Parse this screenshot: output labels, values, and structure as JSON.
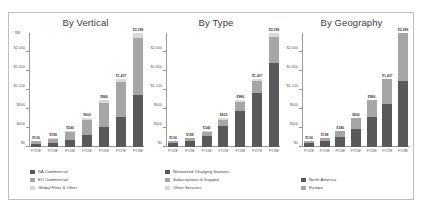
{
  "chart_data": [
    {
      "type": "bar",
      "title": "By Vertical",
      "subtype": "stacked",
      "units_label": "$M",
      "xlabel": "",
      "ylabel": "$M",
      "ylim": [
        0,
        2400
      ],
      "yticks": [
        0,
        400,
        800,
        1200,
        1600,
        2000
      ],
      "ytick_labels": [
        "$0",
        "$400",
        "$800",
        "$1,200",
        "$1,600",
        "$2,000"
      ],
      "grid": false,
      "legend_position": "bottom-left",
      "categories": [
        "FY22E",
        "FY23E",
        "FY24E",
        "FY25E",
        "FY26E",
        "FY27E",
        "FY28E"
      ],
      "totals": [
        136,
        198,
        346,
        602,
        986,
        1437,
        2399
      ],
      "total_labels": [
        "$136",
        "$198",
        "$346",
        "$602",
        "$986",
        "$1,437",
        "$2,399"
      ],
      "series": [
        {
          "name": "NA Commercial",
          "color": "#595959",
          "values": [
            62,
            88,
            150,
            262,
            430,
            640,
            1090
          ]
        },
        {
          "name": "EU Commercial",
          "color": "#a6a6a6",
          "values": [
            58,
            88,
            160,
            300,
            500,
            730,
            1210
          ]
        },
        {
          "name": "Global Fleet & Other",
          "color": "#d9d9d9",
          "values": [
            16,
            22,
            36,
            40,
            56,
            67,
            99
          ]
        }
      ]
    },
    {
      "type": "bar",
      "title": "By Type",
      "subtype": "stacked",
      "units_label": "$M",
      "xlabel": "",
      "ylabel": "$M",
      "ylim": [
        0,
        2400
      ],
      "yticks": [
        0,
        400,
        800,
        1200,
        1600,
        2000
      ],
      "ytick_labels": [
        "$0",
        "$400",
        "$800",
        "$1,200",
        "$1,600",
        "$2,000"
      ],
      "grid": false,
      "legend_position": "bottom-left",
      "categories": [
        "FY22E",
        "FY23E",
        "FY24E",
        "FY25E",
        "FY26E",
        "FY27E",
        "FY28E"
      ],
      "totals": [
        136,
        198,
        346,
        602,
        986,
        1437,
        2399
      ],
      "total_labels": [
        "$136",
        "$198",
        "$346",
        "$602",
        "$986",
        "$1,437",
        "$2,399"
      ],
      "series": [
        {
          "name": "Networked Charging Stations",
          "color": "#595959",
          "values": [
            76,
            128,
            238,
            446,
            752,
            1130,
            1760
          ]
        },
        {
          "name": "Subscriptions & Support",
          "color": "#a6a6a6",
          "values": [
            44,
            52,
            80,
            124,
            196,
            257,
            559
          ]
        },
        {
          "name": "Other Services",
          "color": "#d9d9d9",
          "values": [
            16,
            18,
            28,
            32,
            38,
            50,
            80
          ]
        }
      ]
    },
    {
      "type": "bar",
      "title": "By Geography",
      "subtype": "stacked",
      "units_label": "$M",
      "xlabel": "",
      "ylabel": "$M",
      "ylim": [
        0,
        2400
      ],
      "yticks": [
        0,
        400,
        800,
        1200,
        1600,
        2000
      ],
      "ytick_labels": [
        "$0",
        "$400",
        "$800",
        "$1,200",
        "$1,600",
        "$2,000"
      ],
      "grid": false,
      "legend_position": "bottom-left",
      "categories": [
        "FY22E",
        "FY23E",
        "FY24E",
        "FY25E",
        "FY26E",
        "FY27E",
        "FY28E"
      ],
      "totals": [
        136,
        198,
        346,
        602,
        986,
        1437,
        2399
      ],
      "total_labels": [
        "$136",
        "$198",
        "$346",
        "$602",
        "$986",
        "$1,437",
        "$2,399"
      ],
      "series": [
        {
          "name": "North America",
          "color": "#595959",
          "values": [
            78,
            118,
            210,
            376,
            640,
            900,
            1400
          ]
        },
        {
          "name": "Europe",
          "color": "#a6a6a6",
          "values": [
            58,
            80,
            136,
            226,
            346,
            537,
            999
          ]
        }
      ]
    }
  ],
  "colors": {
    "series_dark": "#595959",
    "series_mid": "#a6a6a6",
    "series_light": "#d9d9d9",
    "axis": "#9a9a9a",
    "border": "#bfbfbf",
    "text": "#404040",
    "background": "#ffffff"
  }
}
